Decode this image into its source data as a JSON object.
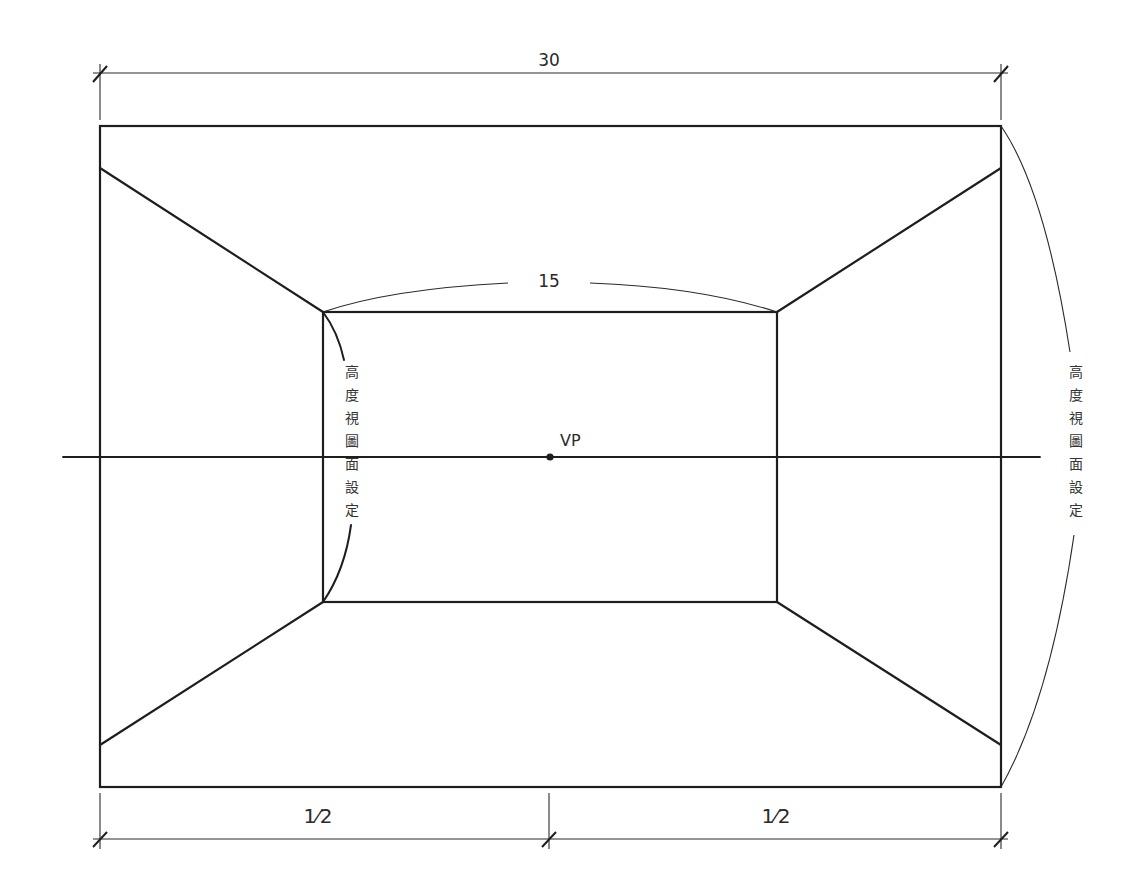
{
  "diagram": {
    "top_dimension": "30",
    "inner_width_dimension": "15",
    "bottom_left_dimension": "1⁄2",
    "bottom_right_dimension": "1⁄2",
    "vanishing_point_label": "VP",
    "left_vertical_label": [
      "高",
      "度",
      "視",
      "圖",
      "面",
      "設",
      "定"
    ],
    "right_vertical_label": [
      "高",
      "度",
      "視",
      "圖",
      "面",
      "設",
      "定"
    ],
    "line_color": "#1e1e1e",
    "background": "#ffffff"
  }
}
